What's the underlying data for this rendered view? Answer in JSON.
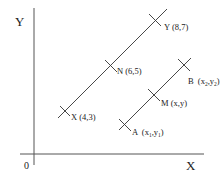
{
  "axes": {
    "y_label": "Y",
    "x_label": "X",
    "origin_label": "0"
  },
  "line1": {
    "points": [
      {
        "name": "X",
        "label": "X (4,3)"
      },
      {
        "name": "N",
        "label": "N (6,5)"
      },
      {
        "name": "Y",
        "label": "Y (8,7)"
      }
    ]
  },
  "line2": {
    "points": [
      {
        "name": "A",
        "label": "A",
        "sub": "(x",
        "s1": "1",
        "mid": ",y",
        "s2": "1",
        "end": ")"
      },
      {
        "name": "M",
        "label": "M (x,y)"
      },
      {
        "name": "B",
        "label": "B",
        "sub": "(x",
        "s1": "2",
        "mid": ",y",
        "s2": "2",
        "end": ")"
      }
    ]
  },
  "colors": {
    "stroke": "#333333",
    "text": "#222222",
    "background": "#ffffff"
  }
}
